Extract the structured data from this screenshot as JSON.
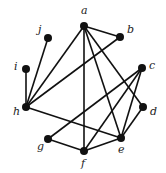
{
  "graph": {
    "nodes": [
      {
        "id": "a",
        "label": "a",
        "x": 84,
        "y": 26,
        "lx": 81,
        "ly": 14
      },
      {
        "id": "b",
        "label": "b",
        "x": 120,
        "y": 37,
        "lx": 127,
        "ly": 33
      },
      {
        "id": "c",
        "label": "c",
        "x": 142,
        "y": 68,
        "lx": 149,
        "ly": 69
      },
      {
        "id": "d",
        "label": "d",
        "x": 143,
        "y": 107,
        "lx": 150,
        "ly": 115
      },
      {
        "id": "e",
        "label": "e",
        "x": 121,
        "y": 138,
        "lx": 118,
        "ly": 153
      },
      {
        "id": "f",
        "label": "f",
        "x": 84,
        "y": 151,
        "lx": 81,
        "ly": 167
      },
      {
        "id": "g",
        "label": "g",
        "x": 48,
        "y": 139,
        "lx": 37,
        "ly": 150
      },
      {
        "id": "h",
        "label": "h",
        "x": 26,
        "y": 107,
        "lx": 13,
        "ly": 115
      },
      {
        "id": "i",
        "label": "i",
        "x": 26,
        "y": 69,
        "lx": 14,
        "ly": 70
      },
      {
        "id": "j",
        "label": "j",
        "x": 48,
        "y": 38,
        "lx": 38,
        "ly": 33
      }
    ],
    "edges": [
      [
        "a",
        "b"
      ],
      [
        "a",
        "h"
      ],
      [
        "a",
        "f"
      ],
      [
        "a",
        "e"
      ],
      [
        "a",
        "d"
      ],
      [
        "b",
        "h"
      ],
      [
        "j",
        "h"
      ],
      [
        "i",
        "h"
      ],
      [
        "h",
        "e"
      ],
      [
        "c",
        "g"
      ],
      [
        "c",
        "f"
      ],
      [
        "c",
        "e"
      ],
      [
        "d",
        "e"
      ],
      [
        "g",
        "f"
      ],
      [
        "f",
        "e"
      ]
    ],
    "node_color": "#111111",
    "edge_color": "#111111"
  }
}
